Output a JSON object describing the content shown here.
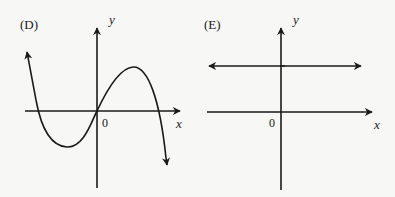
{
  "panels": [
    {
      "id": "D",
      "label": "(D)",
      "x_axis_label": "x",
      "y_axis_label": "y",
      "origin_label": "0",
      "description": "Cubic curve with negative leading coefficient passing through origin: rises from upper-left, dips to a local minimum below x-axis, passes through origin, rises to a local maximum, then falls to lower-right"
    },
    {
      "id": "E",
      "label": "(E)",
      "x_axis_label": "x",
      "y_axis_label": "y",
      "origin_label": "0",
      "description": "Horizontal line above the x-axis with arrows at both ends (constant positive function)"
    }
  ],
  "colors": {
    "background": "#f7f7f5",
    "ink": "#1a1a1a"
  }
}
